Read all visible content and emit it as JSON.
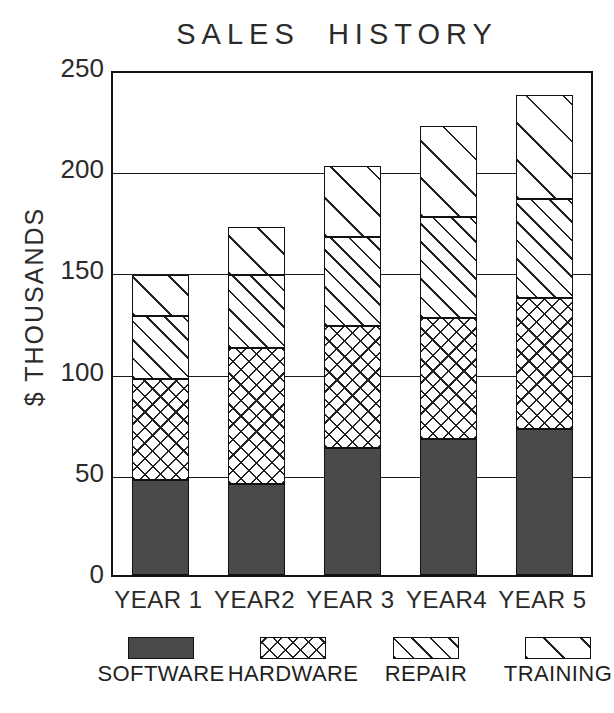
{
  "chart_data": {
    "type": "bar",
    "title": "SALES  HISTORY",
    "subtitle": "",
    "stacked": true,
    "xlabel": "",
    "ylabel": "$ THOUSANDS",
    "ylim": [
      0,
      250
    ],
    "ytick_labels": [
      "250",
      "200",
      "150",
      "100",
      "50",
      "0"
    ],
    "ytick_values": [
      250,
      200,
      150,
      100,
      50,
      0
    ],
    "grid": "horizontal",
    "legend_position": "bottom",
    "categories": [
      "YEAR 1",
      "YEAR2",
      "YEAR 3",
      "YEAR4",
      "YEAR 5"
    ],
    "series": [
      {
        "name": "SOFTWARE",
        "pattern": "solid-dark",
        "color": "#4a4a4a",
        "values": [
          47,
          45,
          63,
          67,
          72
        ]
      },
      {
        "name": "HARDWARE",
        "pattern": "crosshatch",
        "color": "#ffffff",
        "values": [
          50,
          67,
          60,
          60,
          65
        ]
      },
      {
        "name": "REPAIR",
        "pattern": "diagonal-dense",
        "color": "#ffffff",
        "values": [
          31,
          36,
          44,
          50,
          49
        ]
      },
      {
        "name": "TRAINING",
        "pattern": "diagonal-sparse",
        "color": "#ffffff",
        "values": [
          20,
          24,
          35,
          45,
          51
        ]
      }
    ],
    "totals": [
      148,
      172,
      202,
      222,
      237
    ]
  },
  "legend": {
    "items": [
      {
        "label": "SOFTWARE",
        "swatch": "fill-software"
      },
      {
        "label": "HARDWARE",
        "swatch": "fill-hardware"
      },
      {
        "label": "REPAIR",
        "swatch": "fill-repair"
      },
      {
        "label": "TRAINING",
        "swatch": "fill-training"
      }
    ]
  },
  "colors": {
    "software": "#4a4a4a",
    "axis": "#111111",
    "text": "#2b2b2b",
    "background": "#ffffff"
  }
}
